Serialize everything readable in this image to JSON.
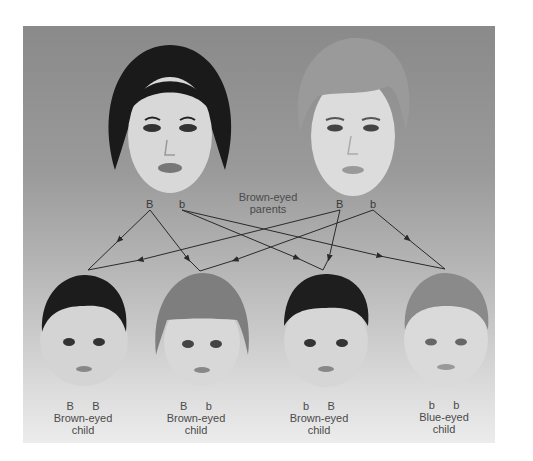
{
  "parents": {
    "label": "Brown-eyed parents",
    "label_line1": "Brown-eyed",
    "label_line2": "parents",
    "mother": {
      "alleles": [
        "B",
        "b"
      ]
    },
    "father": {
      "alleles": [
        "B",
        "b"
      ]
    }
  },
  "children": [
    {
      "alleles": [
        "B",
        "B"
      ],
      "label_line1": "Brown-eyed",
      "label_line2": "child"
    },
    {
      "alleles": [
        "B",
        "b"
      ],
      "label_line1": "Brown-eyed",
      "label_line2": "child"
    },
    {
      "alleles": [
        "b",
        "B"
      ],
      "label_line1": "Brown-eyed",
      "label_line2": "child"
    },
    {
      "alleles": [
        "b",
        "b"
      ],
      "label_line1": "Blue-eyed",
      "label_line2": "child"
    }
  ],
  "colors": {
    "line": "#2a2a2a",
    "text": "#4a4a4a"
  }
}
